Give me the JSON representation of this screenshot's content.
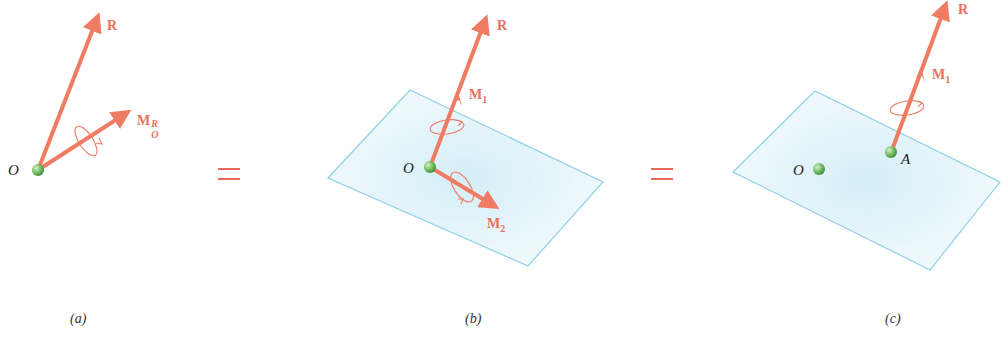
{
  "figure": {
    "colors": {
      "vector": "#ef7b63",
      "vector_label": "#e8705c",
      "point_fill": "#7cc46a",
      "plane_stroke": "#8fd0e6",
      "plane_fill": "#e6f6fb",
      "equals": "#e96a5a",
      "text": "#222222"
    },
    "equals_symbol": "=",
    "panels": [
      {
        "caption": "(a)",
        "point_label": "O",
        "vectors": [
          {
            "label": "R",
            "name": "resultant-force"
          },
          {
            "label": "M",
            "sub": "O",
            "sup": "R",
            "name": "resultant-moment"
          }
        ]
      },
      {
        "caption": "(b)",
        "point_label": "O",
        "vectors": [
          {
            "label": "R",
            "name": "resultant-force"
          },
          {
            "label": "M",
            "sub": "1",
            "name": "moment-parallel"
          },
          {
            "label": "M",
            "sub": "2",
            "name": "moment-perpendicular"
          }
        ]
      },
      {
        "caption": "(c)",
        "point_labels": [
          "O",
          "A"
        ],
        "vectors": [
          {
            "label": "R",
            "name": "resultant-force"
          },
          {
            "label": "M",
            "sub": "1",
            "name": "moment-parallel"
          }
        ]
      }
    ]
  }
}
